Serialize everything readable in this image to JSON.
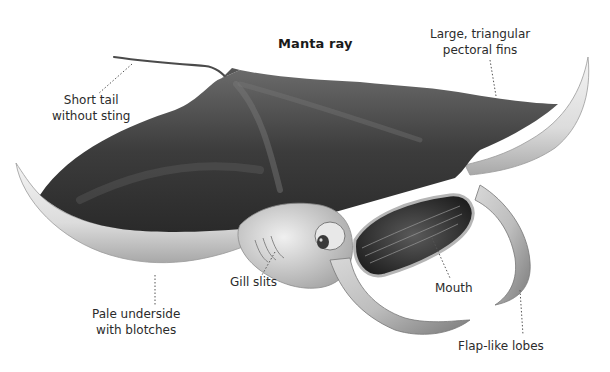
{
  "diagram": {
    "title": "Manta ray",
    "colors": {
      "background": "#ffffff",
      "body_dark": "#3a3a3a",
      "body_mid": "#5e5e5e",
      "underside_pale": "#e6e6e6",
      "label_text": "#2b2b2b",
      "leader_line": "#555555"
    },
    "labels": [
      {
        "id": "tail",
        "lines": [
          "Short tail",
          "without sting"
        ]
      },
      {
        "id": "fins",
        "lines": [
          "Large, triangular",
          "pectoral fins"
        ]
      },
      {
        "id": "underside",
        "lines": [
          "Pale underside",
          "with blotches"
        ]
      },
      {
        "id": "gills",
        "lines": [
          "Gill slits"
        ]
      },
      {
        "id": "mouth",
        "lines": [
          "Mouth"
        ]
      },
      {
        "id": "lobes",
        "lines": [
          "Flap-like lobes"
        ]
      }
    ]
  }
}
